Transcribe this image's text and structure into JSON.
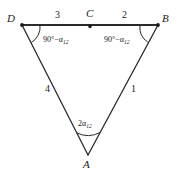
{
  "figure": {
    "line_color": "#2b2b2b",
    "text_color": "#1a1a1a",
    "vertices": [
      {
        "name": "D",
        "label": "D",
        "x": 22,
        "y": 25,
        "dot": true
      },
      {
        "name": "C",
        "label": "C",
        "x": 90,
        "y": 25,
        "dot": true
      },
      {
        "name": "B",
        "label": "B",
        "x": 158,
        "y": 25,
        "dot": true
      },
      {
        "name": "A",
        "label": "A",
        "x": 88,
        "y": 155,
        "dot": false
      }
    ],
    "segments": [
      {
        "name": "segment-DC",
        "label": "3",
        "from": "D",
        "to": "C"
      },
      {
        "name": "segment-CB",
        "label": "2",
        "from": "C",
        "to": "B"
      },
      {
        "name": "segment-DA",
        "label": "4",
        "from": "D",
        "to": "A"
      },
      {
        "name": "segment-BA",
        "label": "1",
        "from": "B",
        "to": "A"
      }
    ],
    "angles": [
      {
        "name": "angle-at-D",
        "label": "90°−α",
        "subscript": "12",
        "at": "D"
      },
      {
        "name": "angle-at-B",
        "label": "90°−α",
        "subscript": "12",
        "at": "B"
      },
      {
        "name": "angle-at-A",
        "label": "2α",
        "subscript": "12",
        "at": "A"
      }
    ]
  }
}
